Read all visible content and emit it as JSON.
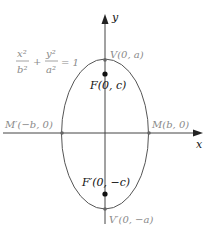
{
  "diagram": {
    "equation": {
      "x_num": "x²",
      "x_den": "b²",
      "plus": "+",
      "y_num": "y²",
      "y_den": "a²",
      "rhs": "= 1"
    },
    "axes": {
      "x_label": "x",
      "y_label": "y"
    },
    "points": {
      "V": "V(0, a)",
      "F": "F(0, c)",
      "M_prime": "M′(−b, 0)",
      "M": "M(b, 0)",
      "F_prime": "F′(0, −c)",
      "V_prime": "V′(0, −a)"
    },
    "colors": {
      "curve": "#555555",
      "axis": "#333333",
      "label_gray": "#8a8a8a",
      "label_dark": "#111111"
    }
  }
}
